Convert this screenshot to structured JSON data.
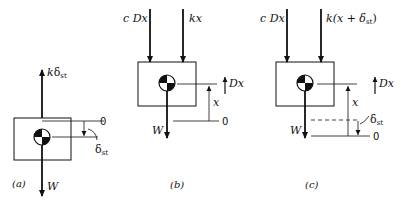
{
  "panels": [
    {
      "caption": "(a)",
      "forces": [
        {
          "label": "k",
          "symbol": "δ",
          "subscript": "st",
          "direction": "up"
        },
        {
          "label": "W",
          "direction": "down"
        }
      ],
      "reference_label": "0",
      "displacement_label": {
        "symbol": "δ",
        "subscript": "st"
      }
    },
    {
      "caption": "(b)",
      "forces": [
        {
          "label": "c Dx",
          "direction": "down"
        },
        {
          "label": "kx",
          "direction": "down"
        },
        {
          "label": "W",
          "direction": "down"
        }
      ],
      "velocity_label": "Dx",
      "displacement_label": "x",
      "reference_label": "0"
    },
    {
      "caption": "(c)",
      "forces": [
        {
          "label": "c Dx",
          "direction": "down"
        },
        {
          "label": "k(x + δ",
          "subscript": "st",
          "close": ")",
          "direction": "down"
        },
        {
          "label": "W",
          "direction": "down"
        }
      ],
      "velocity_label": "Dx",
      "displacement_label": "x",
      "static_label": {
        "symbol": "δ",
        "subscript": "st"
      },
      "reference_label": "0"
    }
  ],
  "icons": {
    "center_of_mass": "center-of-mass-symbol"
  }
}
